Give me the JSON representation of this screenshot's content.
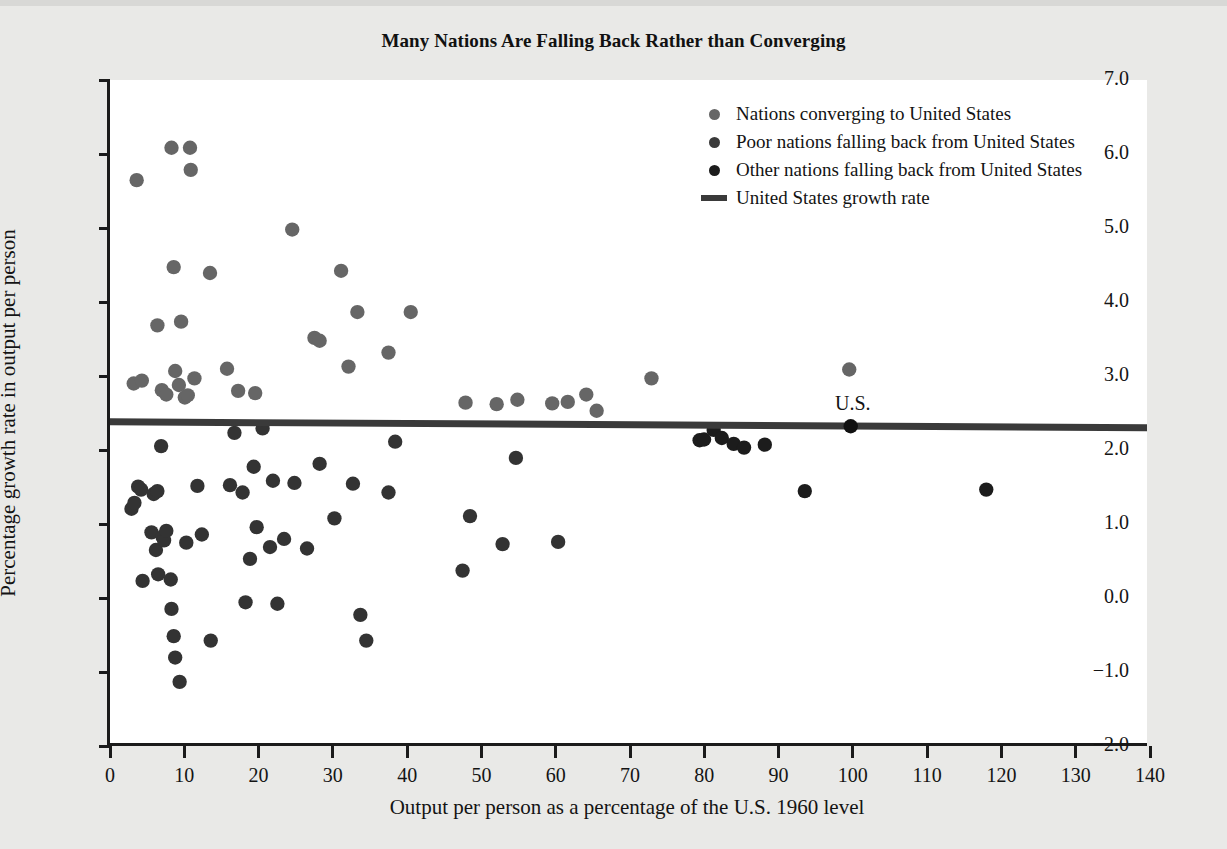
{
  "chart_data": {
    "type": "scatter",
    "title": "Many Nations Are Falling Back Rather than Converging",
    "xlabel": "Output per person as a percentage of the U.S. 1960 level",
    "ylabel": "Percentage growth rate in output per person",
    "xlim": [
      0,
      140
    ],
    "ylim": [
      -2.0,
      7.0
    ],
    "xticks": [
      0,
      10,
      20,
      30,
      40,
      50,
      60,
      70,
      80,
      90,
      100,
      110,
      120,
      130,
      140
    ],
    "xtick_labels": [
      "0",
      "10",
      "20",
      "30",
      "40",
      "50",
      "60",
      "70",
      "80",
      "90",
      "100",
      "110",
      "120",
      "130",
      "140"
    ],
    "yticks": [
      -2.0,
      -1.0,
      0.0,
      1.0,
      2.0,
      3.0,
      4.0,
      5.0,
      6.0,
      7.0
    ],
    "ytick_labels": [
      "-2.0",
      "-1.0",
      "0.0",
      "1.0",
      "2.0",
      "3.0",
      "4.0",
      "5.0",
      "6.0",
      "7.0"
    ],
    "grid": false,
    "legend_position": "top-right",
    "reference_line": {
      "name": "United States growth rate",
      "label": "U.S.",
      "color": "#3a3a3a",
      "y_at_xmin": 2.36,
      "y_at_xmax": 2.28,
      "marker_point": {
        "x": 100,
        "y": 2.3
      }
    },
    "series": [
      {
        "name": "Nations converging to United States",
        "color": "#666666",
        "points": [
          [
            3.2,
            2.88
          ],
          [
            3.6,
            5.64
          ],
          [
            4.3,
            2.92
          ],
          [
            6.4,
            3.67
          ],
          [
            7.0,
            2.79
          ],
          [
            7.6,
            2.73
          ],
          [
            8.3,
            6.08
          ],
          [
            8.6,
            4.46
          ],
          [
            8.8,
            3.05
          ],
          [
            9.3,
            2.86
          ],
          [
            9.6,
            3.72
          ],
          [
            10.1,
            2.69
          ],
          [
            10.5,
            2.72
          ],
          [
            10.8,
            6.08
          ],
          [
            10.9,
            5.78
          ],
          [
            11.4,
            2.95
          ],
          [
            13.5,
            4.38
          ],
          [
            15.8,
            3.08
          ],
          [
            17.3,
            2.78
          ],
          [
            19.6,
            2.75
          ],
          [
            24.6,
            4.97
          ],
          [
            27.6,
            3.5
          ],
          [
            28.3,
            3.46
          ],
          [
            31.2,
            4.41
          ],
          [
            32.2,
            3.11
          ],
          [
            33.4,
            3.85
          ],
          [
            37.6,
            3.3
          ],
          [
            40.6,
            3.85
          ],
          [
            48.0,
            2.62
          ],
          [
            52.2,
            2.6
          ],
          [
            55.0,
            2.66
          ],
          [
            59.7,
            2.61
          ],
          [
            61.8,
            2.63
          ],
          [
            64.3,
            2.73
          ],
          [
            65.7,
            2.51
          ],
          [
            73.1,
            2.95
          ],
          [
            99.8,
            3.07
          ]
        ]
      },
      {
        "name": "Poor nations falling back from United States",
        "color": "#333333",
        "points": [
          [
            2.9,
            1.18
          ],
          [
            3.3,
            1.26
          ],
          [
            3.8,
            1.48
          ],
          [
            4.2,
            1.44
          ],
          [
            4.4,
            0.2
          ],
          [
            5.6,
            0.86
          ],
          [
            5.9,
            1.38
          ],
          [
            6.2,
            0.62
          ],
          [
            6.4,
            1.42
          ],
          [
            6.5,
            0.29
          ],
          [
            6.9,
            2.03
          ],
          [
            7.1,
            0.8
          ],
          [
            7.3,
            0.75
          ],
          [
            7.6,
            0.88
          ],
          [
            8.2,
            0.22
          ],
          [
            8.3,
            -0.18
          ],
          [
            8.6,
            -0.55
          ],
          [
            8.8,
            -0.84
          ],
          [
            9.4,
            -1.17
          ],
          [
            10.3,
            0.72
          ],
          [
            11.8,
            1.49
          ],
          [
            12.4,
            0.83
          ],
          [
            13.6,
            -0.61
          ],
          [
            16.2,
            1.5
          ],
          [
            16.8,
            2.21
          ],
          [
            17.9,
            1.4
          ],
          [
            18.3,
            -0.09
          ],
          [
            18.9,
            0.5
          ],
          [
            19.4,
            1.75
          ],
          [
            19.8,
            0.93
          ],
          [
            20.6,
            2.27
          ],
          [
            21.6,
            0.66
          ],
          [
            22.0,
            1.56
          ],
          [
            22.6,
            -0.11
          ],
          [
            23.5,
            0.77
          ],
          [
            24.9,
            1.53
          ],
          [
            26.6,
            0.64
          ],
          [
            28.3,
            1.79
          ],
          [
            30.3,
            1.05
          ],
          [
            32.8,
            1.52
          ],
          [
            33.8,
            -0.26
          ],
          [
            34.6,
            -0.61
          ],
          [
            37.6,
            1.4
          ],
          [
            38.5,
            2.09
          ],
          [
            47.6,
            0.34
          ],
          [
            48.6,
            1.08
          ],
          [
            53.0,
            0.7
          ],
          [
            54.8,
            1.87
          ],
          [
            60.5,
            0.73
          ]
        ]
      },
      {
        "name": "Other nations falling back from United States",
        "color": "#1c1c1c",
        "points": [
          [
            79.6,
            2.11
          ],
          [
            80.2,
            2.12
          ],
          [
            81.5,
            2.25
          ],
          [
            82.6,
            2.14
          ],
          [
            84.2,
            2.06
          ],
          [
            85.6,
            2.01
          ],
          [
            88.4,
            2.05
          ],
          [
            93.8,
            1.42
          ],
          [
            118.3,
            1.44
          ]
        ]
      }
    ]
  },
  "legend": {
    "items": [
      {
        "marker": "dot",
        "label": "Nations converging to United States",
        "color": "#666666"
      },
      {
        "marker": "dot",
        "label": "Poor nations falling back from United States",
        "color": "#3a3a3a"
      },
      {
        "marker": "dot",
        "label": "Other nations falling back from United States",
        "color": "#1c1c1c"
      },
      {
        "marker": "line",
        "label": "United States growth rate",
        "color": "#3a3a3a"
      }
    ]
  }
}
